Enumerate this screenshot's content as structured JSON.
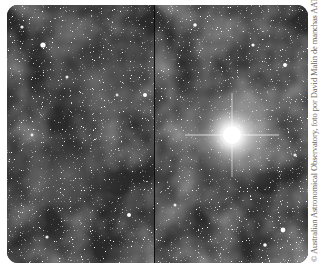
{
  "figure": {
    "panels": [
      {
        "id": "left",
        "label": "Star field with faint nebulosity"
      },
      {
        "id": "right",
        "label": "Star field with bright central star"
      }
    ],
    "bright_star": {
      "panel": "right",
      "x": 232,
      "y": 135
    },
    "colors": {
      "background": "#262626",
      "nebula": "#5a5a5a",
      "star": "#ffffff",
      "divider": "#0c0c0c"
    }
  },
  "credit": "© Australian Astronomical Observatory, foto por David Malin de manchas AAT"
}
